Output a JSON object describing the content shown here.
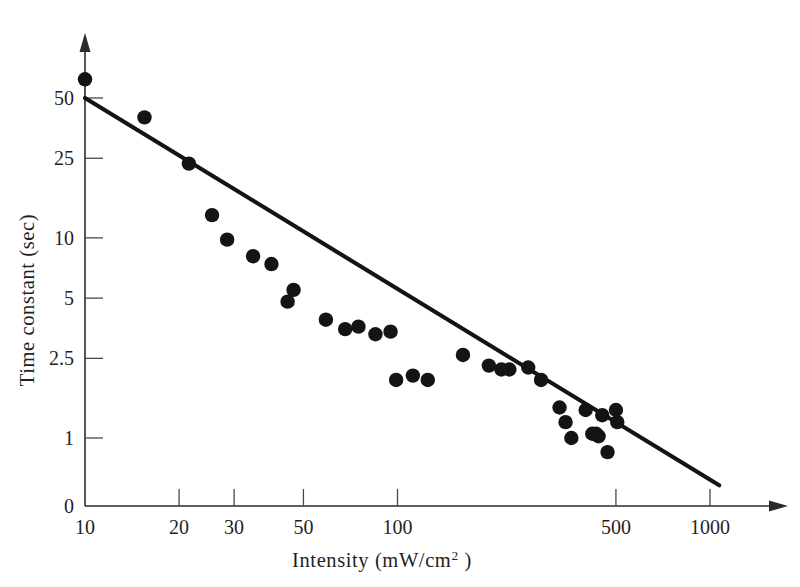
{
  "figure": {
    "background_color": "#ffffff",
    "ink_color": "#141414",
    "marker_color": "#141414"
  },
  "chart_data": {
    "type": "scatter",
    "title": "",
    "subtitle": "",
    "xlabel_text": "Intensity (mW/cm",
    "xlabel_sup": "2",
    "xlabel_tail": " )",
    "xlabel": "Intensity (mW/cm2 )",
    "ylabel": "Time constant (sec)",
    "xscale": "log",
    "yscale": "log",
    "xlim": [
      10,
      1250
    ],
    "ylim": [
      0.55,
      75
    ],
    "grid": false,
    "legend": "none",
    "xticks": [
      {
        "value": 10,
        "label": "10"
      },
      {
        "value": 20,
        "label": "20"
      },
      {
        "value": 30,
        "label": "30"
      },
      {
        "value": 50,
        "label": "50"
      },
      {
        "value": 100,
        "label": "100"
      },
      {
        "value": 500,
        "label": "500"
      },
      {
        "value": 1000,
        "label": "1000"
      }
    ],
    "yticks": [
      {
        "value": 50,
        "label": "50"
      },
      {
        "value": 25,
        "label": "25"
      },
      {
        "value": 10,
        "label": "10"
      },
      {
        "value": 5,
        "label": "5"
      },
      {
        "value": 2.5,
        "label": "2.5"
      },
      {
        "value": 1,
        "label": "1"
      },
      {
        "value": 0,
        "label": "0"
      }
    ],
    "series": [
      {
        "name": "measurements",
        "marker": "filled-circle",
        "points": [
          {
            "x": 10,
            "y": 62
          },
          {
            "x": 15.5,
            "y": 40
          },
          {
            "x": 21.5,
            "y": 23.5
          },
          {
            "x": 25.5,
            "y": 13
          },
          {
            "x": 28.5,
            "y": 9.8
          },
          {
            "x": 34.5,
            "y": 8.1
          },
          {
            "x": 39.5,
            "y": 7.4
          },
          {
            "x": 46.5,
            "y": 5.5
          },
          {
            "x": 44.5,
            "y": 4.8
          },
          {
            "x": 59,
            "y": 3.9
          },
          {
            "x": 68,
            "y": 3.5
          },
          {
            "x": 75,
            "y": 3.6
          },
          {
            "x": 85,
            "y": 3.3
          },
          {
            "x": 95,
            "y": 3.4
          },
          {
            "x": 99,
            "y": 1.95
          },
          {
            "x": 112,
            "y": 2.05
          },
          {
            "x": 125,
            "y": 1.95
          },
          {
            "x": 162,
            "y": 2.6
          },
          {
            "x": 196,
            "y": 2.3
          },
          {
            "x": 215,
            "y": 2.2
          },
          {
            "x": 228,
            "y": 2.2
          },
          {
            "x": 262,
            "y": 2.25
          },
          {
            "x": 288,
            "y": 1.95
          },
          {
            "x": 330,
            "y": 1.42
          },
          {
            "x": 345,
            "y": 1.2
          },
          {
            "x": 360,
            "y": 1.0
          },
          {
            "x": 400,
            "y": 1.38
          },
          {
            "x": 420,
            "y": 1.05
          },
          {
            "x": 432,
            "y": 1.05
          },
          {
            "x": 440,
            "y": 1.02
          },
          {
            "x": 470,
            "y": 0.85
          },
          {
            "x": 500,
            "y": 1.38
          },
          {
            "x": 505,
            "y": 1.2
          },
          {
            "x": 452,
            "y": 1.3
          }
        ]
      }
    ],
    "fit_line": {
      "name": "regression-line",
      "x_start": 10,
      "y_start": 50,
      "x_end": 1070,
      "y_end": 0.58,
      "description": "linear fit on log-log axes"
    }
  }
}
